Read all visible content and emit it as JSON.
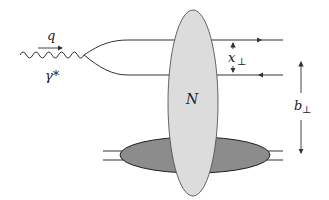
{
  "diagram": {
    "type": "feynman-diagram",
    "labels": {
      "momentum": "q",
      "photon": "γ*",
      "dipole_size": "x",
      "dipole_size_sub": "⊥",
      "impact_parameter": "b",
      "impact_parameter_sub": "⊥",
      "nucleus": "N"
    },
    "colors": {
      "line": "#333333",
      "nucleus_fill": "#dcdcdc",
      "target_fill": "#8c8c8c",
      "background": "#ffffff"
    }
  }
}
